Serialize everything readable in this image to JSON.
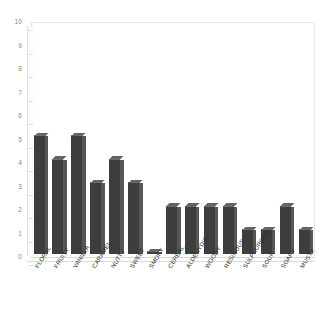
{
  "chart_data": {
    "type": "bar",
    "title": "",
    "subtitle": "",
    "xlabel": "",
    "ylabel": "",
    "ylim": [
      0,
      10
    ],
    "ytick_step": 1,
    "yticks": [
      "0",
      "1",
      "2",
      "3",
      "4",
      "5",
      "6",
      "7",
      "8",
      "9",
      "10"
    ],
    "grid": false,
    "legend": null,
    "legend_position": "none",
    "bar_color": "#3d3d3d",
    "bar_side_color": "#565656",
    "bar_top_color": "#636363",
    "frame_color": "#dedede",
    "tick_label_color": "#8a8a8a",
    "category_label_color": "#2b2b2b",
    "category_label_rotation": -58,
    "categories": [
      "FLORAL",
      "FRUITY",
      "VANILLA",
      "CARAMEL",
      "NUTTY",
      "SWEET",
      "SMOKY",
      "CEREAL",
      "ALDEHYDIC",
      "WOODY",
      "RESINOUS",
      "SULPHUROUS",
      "SOUR",
      "SOAPY",
      "MUSTY"
    ],
    "values": [
      5,
      4,
      5,
      3,
      4,
      3,
      0,
      2,
      2,
      2,
      2,
      1,
      1,
      2,
      1
    ]
  }
}
